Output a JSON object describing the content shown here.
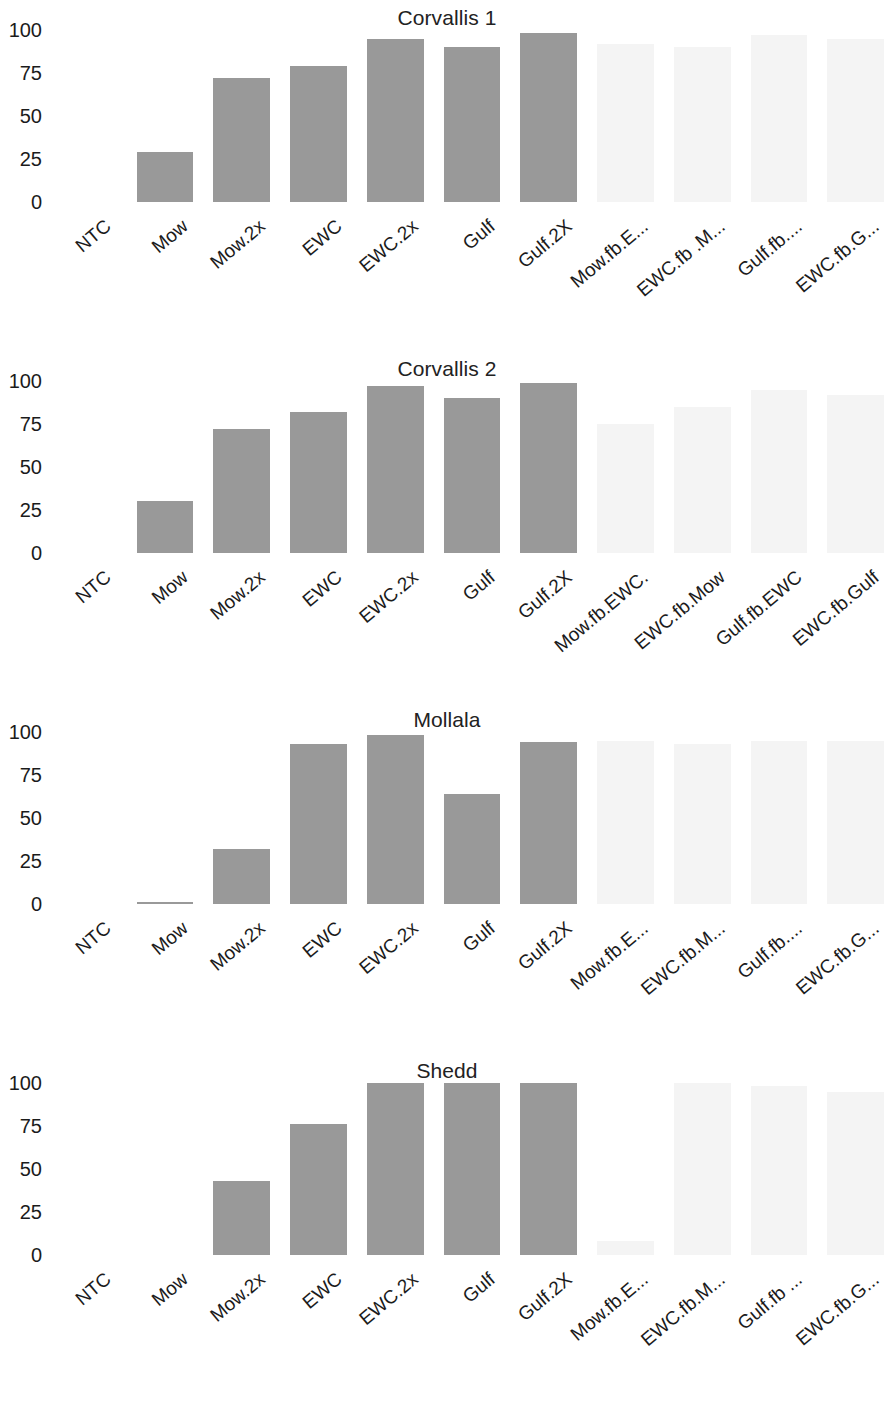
{
  "figure": {
    "panel_count": 4,
    "bar_color": "#999999",
    "background": "#ffffff",
    "y_ticks": [
      "0",
      "25",
      "50",
      "75",
      "100"
    ]
  },
  "chart_data": [
    {
      "type": "bar",
      "title": "Corvallis 1",
      "xlabel": "",
      "ylabel": "",
      "ylim": [
        0,
        100
      ],
      "yticks": [
        0,
        25,
        50,
        75,
        100
      ],
      "grid": false,
      "legend": "none",
      "categories": [
        "NTC",
        "Mow",
        "Mow.2x",
        "EWC",
        "EWC.2x",
        "Gulf",
        "Gulf.2X",
        "Mow.fb.E...",
        "EWC.fb .M...",
        "Gulf.fb....",
        "EWC.fb.G..."
      ],
      "values": [
        0,
        29,
        72,
        79,
        95,
        90,
        98,
        92,
        90,
        97,
        95
      ],
      "faint": [
        false,
        false,
        false,
        false,
        false,
        false,
        false,
        true,
        true,
        true,
        true
      ]
    },
    {
      "type": "bar",
      "title": "Corvallis 2",
      "xlabel": "",
      "ylabel": "",
      "ylim": [
        0,
        100
      ],
      "yticks": [
        0,
        25,
        50,
        75,
        100
      ],
      "grid": false,
      "legend": "none",
      "categories": [
        "NTC",
        "Mow",
        "Mow.2x",
        "EWC",
        "EWC.2x",
        "Gulf",
        "Gulf.2X",
        "Mow.fb.EWC.",
        "EWC.fb.Mow",
        "Gulf.fb.EWC",
        "EWC.fb.Gulf"
      ],
      "values": [
        0,
        30,
        72,
        82,
        97,
        90,
        99,
        75,
        85,
        95,
        92
      ],
      "faint": [
        false,
        false,
        false,
        false,
        false,
        false,
        false,
        true,
        true,
        true,
        true
      ]
    },
    {
      "type": "bar",
      "title": "Mollala",
      "xlabel": "",
      "ylabel": "",
      "ylim": [
        0,
        100
      ],
      "yticks": [
        0,
        25,
        50,
        75,
        100
      ],
      "grid": false,
      "legend": "none",
      "categories": [
        "NTC",
        "Mow",
        "Mow.2x",
        "EWC",
        "EWC.2x",
        "Gulf",
        "Gulf.2X",
        "Mow.fb.E...",
        "EWC.fb.M...",
        "Gulf.fb....",
        "EWC.fb.G..."
      ],
      "values": [
        0,
        1,
        32,
        93,
        98,
        64,
        94,
        95,
        93,
        95,
        95
      ],
      "faint": [
        false,
        false,
        false,
        false,
        false,
        false,
        false,
        true,
        true,
        true,
        true
      ]
    },
    {
      "type": "bar",
      "title": "Shedd",
      "xlabel": "",
      "ylabel": "",
      "ylim": [
        0,
        100
      ],
      "yticks": [
        0,
        25,
        50,
        75,
        100
      ],
      "grid": false,
      "legend": "none",
      "categories": [
        "NTC",
        "Mow",
        "Mow.2x",
        "EWC",
        "EWC.2x",
        "Gulf",
        "Gulf.2X",
        "Mow.fb.E...",
        "EWC.fb.M...",
        "Gulf.fb ...",
        "EWC.fb.G..."
      ],
      "values": [
        0,
        0,
        43,
        76,
        100,
        100,
        100,
        8,
        100,
        98,
        95
      ],
      "faint": [
        false,
        false,
        false,
        false,
        false,
        false,
        false,
        true,
        true,
        true,
        true
      ]
    }
  ]
}
